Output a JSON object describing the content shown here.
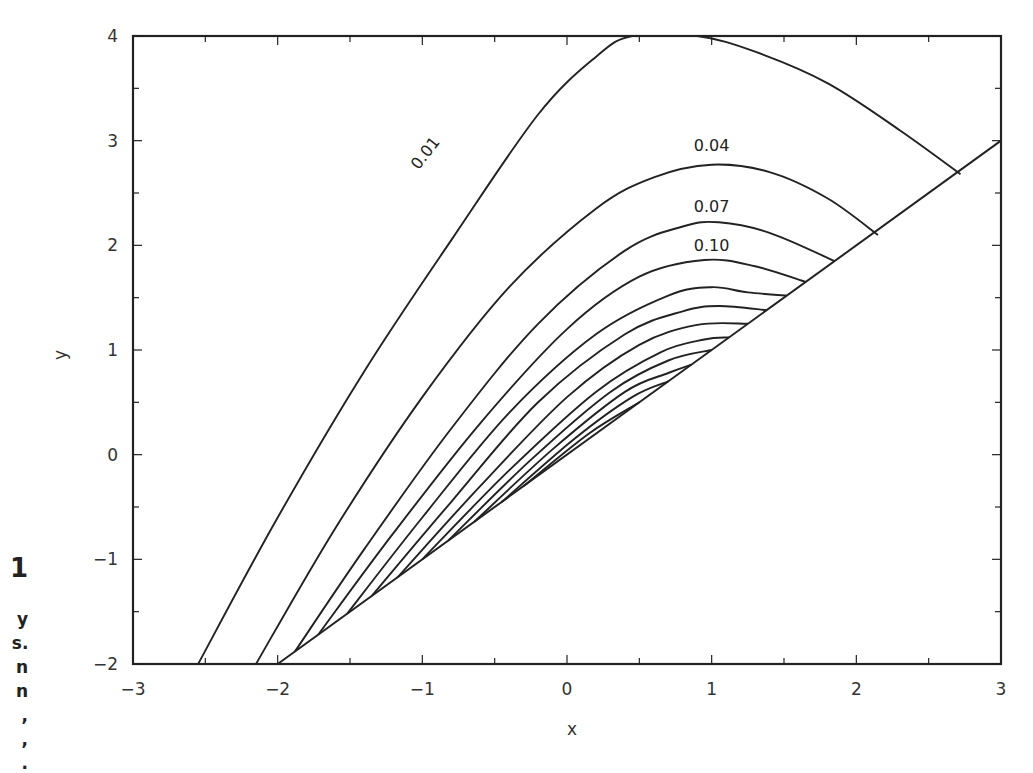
{
  "caption": {
    "figure_number_fragment": "1",
    "line_fragments": [
      "y",
      "s.",
      "n",
      "n",
      ",",
      ",",
      "."
    ]
  },
  "chart_data": {
    "type": "line",
    "subtype": "contour",
    "title": "",
    "xlabel": "x",
    "ylabel": "y",
    "xlim": [
      -3,
      3
    ],
    "ylim": [
      -2,
      4
    ],
    "xticks": [
      -3,
      -2,
      -1,
      0,
      1,
      2,
      3
    ],
    "yticks": [
      -2,
      -1,
      0,
      1,
      2,
      3,
      4
    ],
    "xtick_labels": [
      "−3",
      "−2",
      "−1",
      "0",
      "1",
      "2",
      "3"
    ],
    "ytick_labels": [
      "−2",
      "−1",
      "0",
      "1",
      "2",
      "3",
      "4"
    ],
    "grid": false,
    "boundary_line": {
      "equation": "y = x",
      "from": [
        -2,
        -2
      ],
      "to": [
        3,
        3
      ]
    },
    "contour_labels": [
      {
        "text": "0.01",
        "x": -0.95,
        "y": 2.85,
        "rotation": -52
      },
      {
        "text": "0.04",
        "x": 1.0,
        "y": 2.9
      },
      {
        "text": "0.07",
        "x": 1.0,
        "y": 2.32
      },
      {
        "text": "0.10",
        "x": 1.0,
        "y": 1.95
      }
    ],
    "series": [
      {
        "name": "0.01",
        "points": [
          [
            -2.55,
            -2
          ],
          [
            -2.0,
            -0.6
          ],
          [
            -1.4,
            0.8
          ],
          [
            -0.8,
            2.05
          ],
          [
            -0.2,
            3.25
          ],
          [
            0.2,
            3.8
          ],
          [
            0.45,
            4.0
          ],
          [
            0.9,
            4.0
          ],
          [
            1.3,
            3.85
          ],
          [
            1.8,
            3.55
          ],
          [
            2.3,
            3.1
          ],
          [
            2.72,
            2.68
          ]
        ]
      },
      {
        "name": "0.04",
        "points": [
          [
            -2.15,
            -2
          ],
          [
            -1.6,
            -0.7
          ],
          [
            -1.0,
            0.55
          ],
          [
            -0.4,
            1.6
          ],
          [
            0.2,
            2.35
          ],
          [
            0.6,
            2.65
          ],
          [
            1.0,
            2.77
          ],
          [
            1.4,
            2.7
          ],
          [
            1.8,
            2.45
          ],
          [
            2.15,
            2.1
          ]
        ]
      },
      {
        "name": "0.07",
        "points": [
          [
            -1.88,
            -1.88
          ],
          [
            -1.4,
            -0.9
          ],
          [
            -0.8,
            0.25
          ],
          [
            -0.2,
            1.25
          ],
          [
            0.4,
            1.95
          ],
          [
            0.8,
            2.18
          ],
          [
            1.05,
            2.22
          ],
          [
            1.4,
            2.12
          ],
          [
            1.85,
            1.85
          ]
        ]
      },
      {
        "name": "0.10",
        "points": [
          [
            -1.72,
            -1.72
          ],
          [
            -1.2,
            -0.75
          ],
          [
            -0.6,
            0.3
          ],
          [
            0.0,
            1.2
          ],
          [
            0.5,
            1.7
          ],
          [
            0.95,
            1.86
          ],
          [
            1.3,
            1.8
          ],
          [
            1.65,
            1.65
          ]
        ]
      },
      {
        "name": "0.13",
        "points": [
          [
            -1.52,
            -1.52
          ],
          [
            -1.0,
            -0.6
          ],
          [
            -0.4,
            0.4
          ],
          [
            0.2,
            1.15
          ],
          [
            0.7,
            1.52
          ],
          [
            1.0,
            1.6
          ],
          [
            1.25,
            1.55
          ],
          [
            1.52,
            1.52
          ]
        ]
      },
      {
        "name": "0.16",
        "points": [
          [
            -1.35,
            -1.35
          ],
          [
            -0.8,
            -0.45
          ],
          [
            -0.2,
            0.5
          ],
          [
            0.4,
            1.15
          ],
          [
            0.8,
            1.37
          ],
          [
            1.05,
            1.42
          ],
          [
            1.38,
            1.38
          ]
        ]
      },
      {
        "name": "0.19",
        "points": [
          [
            -1.17,
            -1.17
          ],
          [
            -0.6,
            -0.3
          ],
          [
            0.0,
            0.55
          ],
          [
            0.5,
            1.05
          ],
          [
            0.9,
            1.24
          ],
          [
            1.25,
            1.25
          ]
        ]
      },
      {
        "name": "0.22",
        "points": [
          [
            -1.0,
            -1.0
          ],
          [
            -0.4,
            -0.15
          ],
          [
            0.2,
            0.6
          ],
          [
            0.65,
            0.98
          ],
          [
            0.95,
            1.1
          ],
          [
            1.12,
            1.12
          ]
        ]
      },
      {
        "name": "0.25",
        "points": [
          [
            -0.82,
            -0.82
          ],
          [
            -0.25,
            -0.05
          ],
          [
            0.3,
            0.6
          ],
          [
            0.7,
            0.9
          ],
          [
            1.0,
            1.0
          ]
        ]
      },
      {
        "name": "0.28",
        "points": [
          [
            -0.64,
            -0.64
          ],
          [
            -0.1,
            0.05
          ],
          [
            0.4,
            0.6
          ],
          [
            0.7,
            0.78
          ],
          [
            0.86,
            0.86
          ]
        ]
      },
      {
        "name": "0.31",
        "points": [
          [
            -0.45,
            -0.45
          ],
          [
            0.05,
            0.15
          ],
          [
            0.45,
            0.55
          ],
          [
            0.7,
            0.7
          ]
        ]
      },
      {
        "name": "0.34",
        "points": [
          [
            -0.3,
            -0.3
          ],
          [
            0.15,
            0.2
          ],
          [
            0.5,
            0.5
          ]
        ]
      }
    ]
  }
}
